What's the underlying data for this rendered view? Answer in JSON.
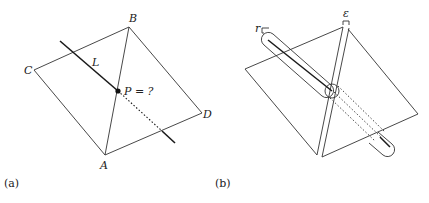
{
  "panels": [
    {
      "caption": "(a)",
      "vertices": {
        "A": "A",
        "B": "B",
        "C": "C",
        "D": "D"
      },
      "line_label": "L",
      "point_label": "P = ?"
    },
    {
      "caption": "(b)",
      "radius_label": "r",
      "epsilon_label": "ε"
    }
  ],
  "colors": {
    "stroke": "#333333",
    "line": "#1a1a1a",
    "background": "#ffffff"
  }
}
